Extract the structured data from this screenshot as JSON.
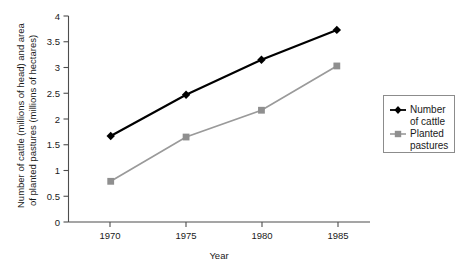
{
  "chart_data": {
    "type": "line",
    "title": "",
    "xlabel": "Year",
    "ylabel": "Number of cattle (millions of head) and area of planted pastures (millions of hectares)",
    "ylabel_line1": "Number of cattle (millions of head) and area",
    "ylabel_line2": "of planted pastures (millions of hectares)",
    "x": [
      1970,
      1975,
      1980,
      1985
    ],
    "categories": [
      "1970",
      "1975",
      "1980",
      "1985"
    ],
    "xlim": [
      1967.2,
      1987.2
    ],
    "ylim": [
      0,
      4
    ],
    "yticks": [
      0,
      0.5,
      1,
      1.5,
      2,
      2.5,
      3,
      3.5,
      4
    ],
    "ytick_labels": [
      "0",
      "0.5",
      "1",
      "1.5",
      "2",
      "2.5",
      "3",
      "3.5",
      "4"
    ],
    "xtick_labels": [
      "1970",
      "1975",
      "1980",
      "1985"
    ],
    "grid": false,
    "legend_position": "right",
    "series": [
      {
        "name": "Number of cattle",
        "name_line1": "Number",
        "name_line2": "of cattle",
        "marker": "diamond",
        "color": "#000000",
        "values": [
          1.67,
          2.47,
          3.15,
          3.73
        ]
      },
      {
        "name": "Planted pastures",
        "name_line1": "Planted",
        "name_line2": "pastures",
        "marker": "square",
        "color": "#8f8f8f",
        "values": [
          0.79,
          1.65,
          2.17,
          3.03
        ]
      }
    ]
  },
  "axes": {
    "x_axis_name": "year-axis",
    "y_axis_name": "value-axis"
  },
  "caption": {
    "sliver_text": ""
  }
}
